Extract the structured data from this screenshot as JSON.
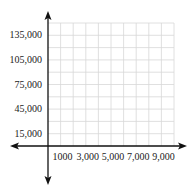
{
  "chart_data": {
    "type": "line",
    "title": "",
    "xlabel": "",
    "ylabel": "",
    "grid": true,
    "xlim": [
      0,
      10000
    ],
    "ylim": [
      0,
      150000
    ],
    "x_ticks": [
      1000,
      3000,
      5000,
      7000,
      9000
    ],
    "x_tick_labels": [
      "1000",
      "3,000",
      "5,000",
      "7,000",
      "9,000"
    ],
    "y_ticks": [
      15000,
      45000,
      75000,
      105000,
      135000
    ],
    "y_tick_labels": [
      "15,000",
      "45,000",
      "75,000",
      "105,000",
      "135,000"
    ],
    "series": [],
    "x_grid_step": 1000,
    "y_grid_step": 15000,
    "axes_arrows": true
  },
  "colors": {
    "axis": "#111111",
    "grid": "#d8d8d8"
  }
}
